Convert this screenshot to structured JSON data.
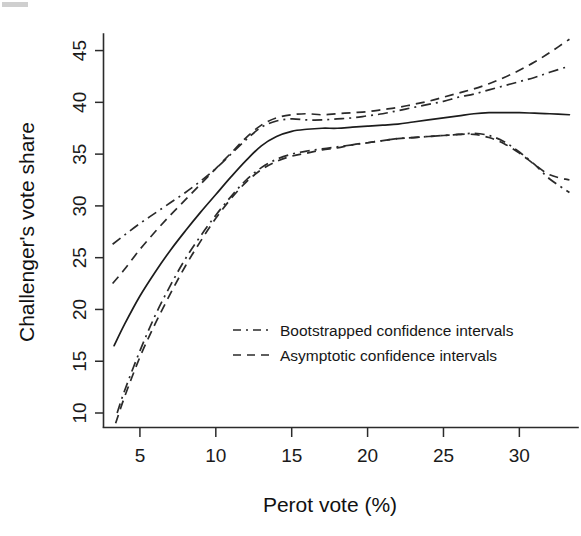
{
  "figure": {
    "background": "#ffffff",
    "ink_color": "#1c1c1c",
    "corner_artifact": "scan-corner-mark"
  },
  "chart_data": {
    "type": "line",
    "title": "",
    "subtitle": "",
    "xlabel": "Perot vote (%)",
    "ylabel": "Challenger's vote share",
    "xlim": [
      2.6,
      33.6
    ],
    "ylim": [
      8.6,
      46.6
    ],
    "xticks": [
      5,
      10,
      15,
      20,
      25,
      30
    ],
    "yticks": [
      10,
      15,
      20,
      25,
      30,
      35,
      40,
      45
    ],
    "xtick_labels": [
      "5",
      "10",
      "15",
      "20",
      "25",
      "30"
    ],
    "ytick_labels": [
      "10",
      "15",
      "20",
      "25",
      "30",
      "35",
      "40",
      "45"
    ],
    "grid": false,
    "legend_position": "center-right-inside",
    "annotations": [],
    "series": [
      {
        "name": "Fitted regression line",
        "style": "solid",
        "color": "#1c1c1c",
        "x": [
          3.3,
          4.0,
          5.0,
          6.0,
          7.0,
          8.0,
          9.0,
          10.0,
          11.0,
          12.0,
          13.0,
          14.0,
          15.0,
          16.0,
          17.0,
          18.0,
          19.0,
          20.0,
          21.0,
          22.0,
          23.0,
          24.0,
          25.0,
          26.0,
          27.0,
          28.0,
          29.0,
          30.0,
          31.0,
          32.0,
          33.3
        ],
        "y": [
          16.5,
          18.6,
          21.3,
          23.6,
          25.7,
          27.6,
          29.4,
          31.1,
          32.8,
          34.4,
          35.8,
          36.7,
          37.2,
          37.4,
          37.5,
          37.5,
          37.6,
          37.7,
          37.8,
          37.9,
          38.1,
          38.3,
          38.5,
          38.7,
          38.9,
          39.0,
          39.0,
          39.0,
          38.95,
          38.9,
          38.8
        ]
      },
      {
        "name": "Bootstrapped confidence interval (upper)",
        "style": "dash-dot",
        "color": "#2a2a2a",
        "x": [
          3.2,
          4.0,
          5.0,
          6.0,
          7.0,
          8.0,
          9.0,
          10.0,
          11.0,
          12.0,
          13.0,
          14.0,
          15.0,
          16.0,
          17.0,
          18.0,
          19.0,
          20.0,
          21.0,
          22.0,
          23.0,
          24.0,
          25.0,
          26.0,
          27.0,
          28.0,
          29.0,
          30.0,
          31.0,
          32.0,
          33.3
        ],
        "y": [
          26.3,
          27.2,
          28.3,
          29.3,
          30.3,
          31.3,
          32.4,
          33.6,
          35.0,
          36.4,
          37.6,
          38.2,
          38.4,
          38.3,
          38.3,
          38.4,
          38.5,
          38.7,
          38.9,
          39.2,
          39.5,
          39.8,
          40.1,
          40.5,
          40.8,
          41.2,
          41.6,
          42.0,
          42.4,
          42.9,
          43.5
        ]
      },
      {
        "name": "Bootstrapped confidence interval (lower)",
        "style": "dash-dot",
        "color": "#2a2a2a",
        "x": [
          3.5,
          4.0,
          5.0,
          6.0,
          7.0,
          8.0,
          9.0,
          10.0,
          11.0,
          12.0,
          13.0,
          14.0,
          15.0,
          16.0,
          17.0,
          18.0,
          19.0,
          20.0,
          21.0,
          22.0,
          23.0,
          24.0,
          25.0,
          26.0,
          27.0,
          28.0,
          29.0,
          30.0,
          31.0,
          32.0,
          33.3
        ],
        "y": [
          10.0,
          12.2,
          16.0,
          19.4,
          22.3,
          24.9,
          27.1,
          29.1,
          30.9,
          32.5,
          33.7,
          34.5,
          35.0,
          35.3,
          35.5,
          35.7,
          35.9,
          36.1,
          36.3,
          36.5,
          36.6,
          36.7,
          36.8,
          36.9,
          37.0,
          36.8,
          36.2,
          35.2,
          34.0,
          32.6,
          31.3
        ]
      },
      {
        "name": "Asymptotic confidence interval (upper)",
        "style": "dashed",
        "color": "#2a2a2a",
        "x": [
          3.2,
          4.0,
          5.0,
          6.0,
          7.0,
          8.0,
          9.0,
          10.0,
          11.0,
          12.0,
          13.0,
          14.0,
          15.0,
          16.0,
          17.0,
          18.0,
          19.0,
          20.0,
          21.0,
          22.0,
          23.0,
          24.0,
          25.0,
          26.0,
          27.0,
          28.0,
          29.0,
          30.0,
          31.0,
          32.0,
          33.3
        ],
        "y": [
          22.5,
          23.9,
          25.8,
          27.5,
          29.1,
          30.6,
          32.1,
          33.6,
          35.1,
          36.6,
          37.8,
          38.5,
          38.8,
          38.9,
          38.8,
          38.9,
          39.0,
          39.1,
          39.3,
          39.5,
          39.8,
          40.1,
          40.5,
          40.9,
          41.3,
          41.8,
          42.4,
          43.1,
          43.9,
          44.8,
          46.1
        ]
      },
      {
        "name": "Asymptotic confidence interval (lower)",
        "style": "dashed",
        "color": "#2a2a2a",
        "x": [
          3.4,
          4.0,
          5.0,
          6.0,
          7.0,
          8.0,
          9.0,
          10.0,
          11.0,
          12.0,
          13.0,
          14.0,
          15.0,
          16.0,
          17.0,
          18.0,
          19.0,
          20.0,
          21.0,
          22.0,
          23.0,
          24.0,
          25.0,
          26.0,
          27.0,
          28.0,
          29.0,
          30.0,
          31.0,
          32.0,
          33.3
        ],
        "y": [
          9.0,
          11.6,
          15.4,
          18.6,
          21.5,
          24.2,
          26.6,
          28.8,
          30.7,
          32.3,
          33.5,
          34.3,
          34.8,
          35.1,
          35.4,
          35.6,
          35.9,
          36.1,
          36.3,
          36.5,
          36.6,
          36.7,
          36.8,
          36.9,
          36.9,
          36.6,
          36.0,
          35.1,
          34.0,
          33.0,
          32.5
        ]
      }
    ],
    "legend": [
      {
        "label": "Bootstrapped confidence intervals",
        "style": "dash-dot"
      },
      {
        "label": "Asymptotic confidence intervals",
        "style": "dashed"
      }
    ]
  }
}
